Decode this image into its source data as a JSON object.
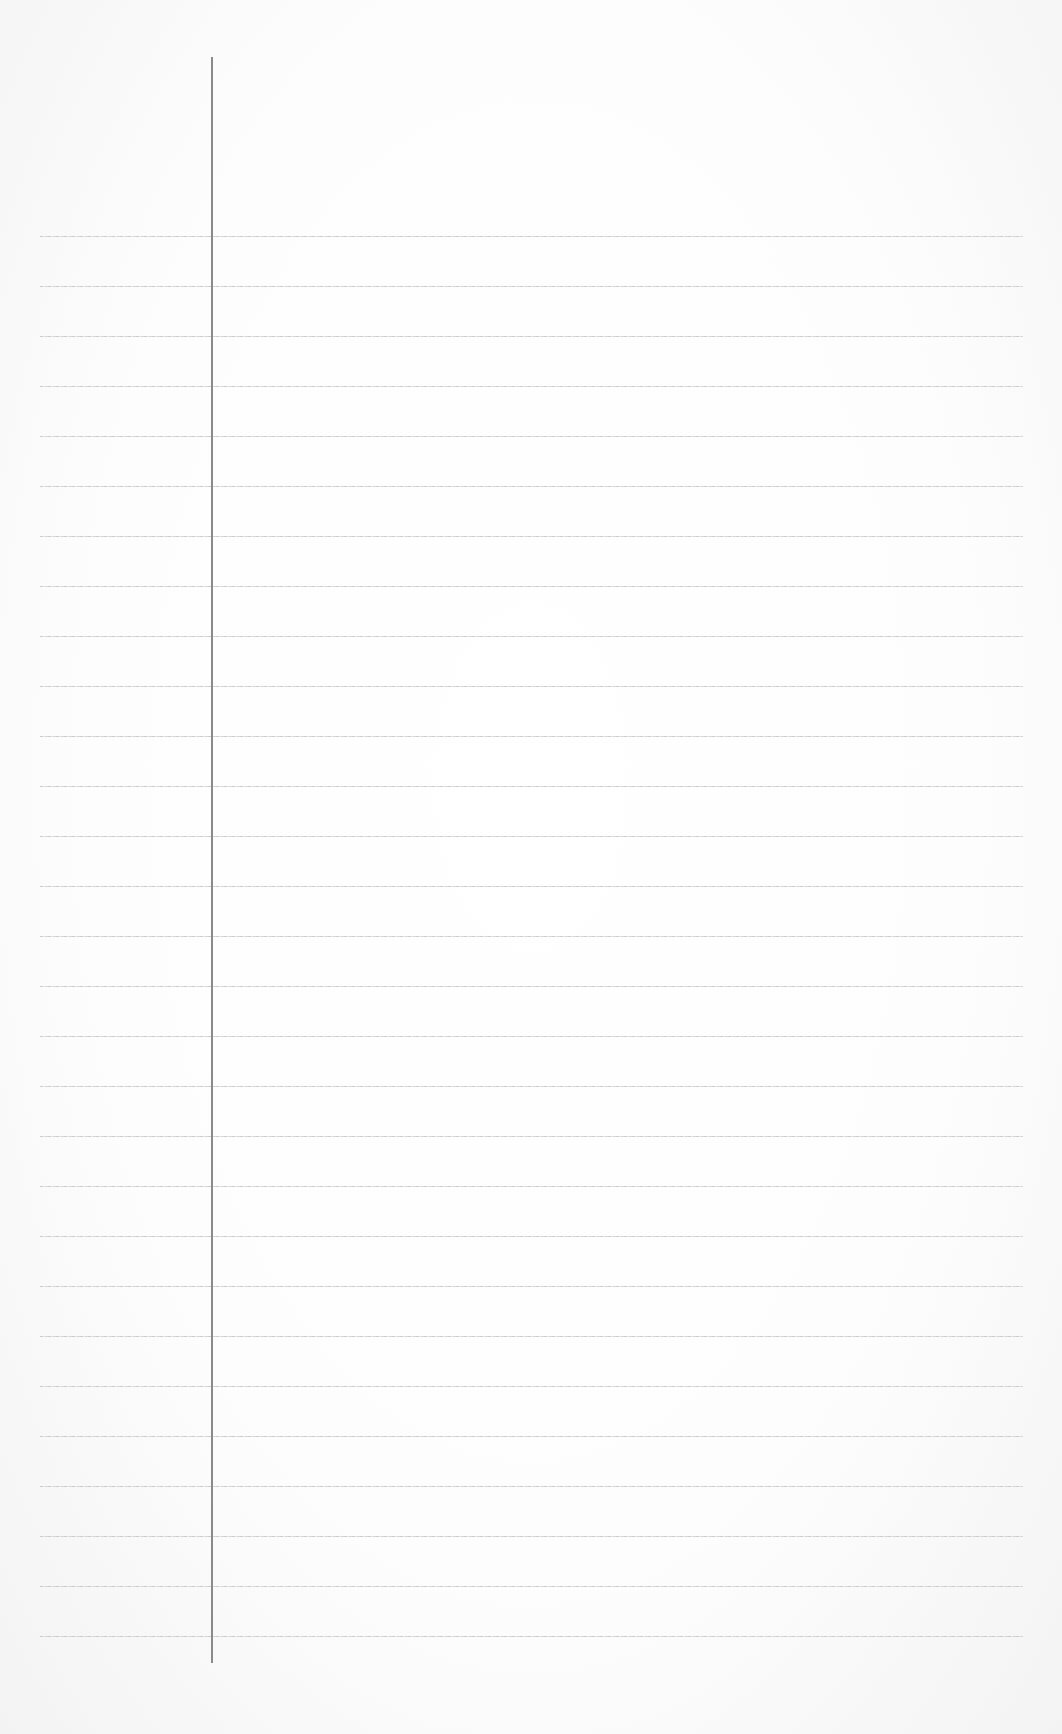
{
  "page": {
    "type": "blank-ruled-paper",
    "background_color": "#fbfbfb",
    "rule_color": "#c8c8c8",
    "margin_line_color": "#8a8a8a"
  },
  "ruling": {
    "line_count": 29,
    "first_line_y": 236,
    "line_spacing": 50,
    "line_left_x": 40,
    "line_right_x": 1023
  },
  "margin_line": {
    "x": 211,
    "top_y": 57,
    "bottom_y": 1663
  }
}
